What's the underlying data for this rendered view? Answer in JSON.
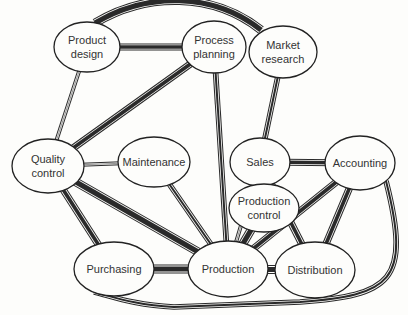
{
  "diagram": {
    "type": "network",
    "nodes": [
      {
        "id": "product_design",
        "lines": [
          "Product",
          "design"
        ],
        "cx": 87,
        "cy": 47,
        "rx": 33,
        "ry": 25
      },
      {
        "id": "process_planning",
        "lines": [
          "Process",
          "planning"
        ],
        "cx": 214,
        "cy": 47,
        "rx": 32,
        "ry": 26
      },
      {
        "id": "market_research",
        "lines": [
          "Market",
          "research"
        ],
        "cx": 283,
        "cy": 52,
        "rx": 34,
        "ry": 26
      },
      {
        "id": "quality_control",
        "lines": [
          "Quality",
          "control"
        ],
        "cx": 48,
        "cy": 166,
        "rx": 36,
        "ry": 27
      },
      {
        "id": "maintenance",
        "lines": [
          "Maintenance"
        ],
        "cx": 154,
        "cy": 162,
        "rx": 36,
        "ry": 25
      },
      {
        "id": "sales",
        "lines": [
          "Sales"
        ],
        "cx": 260,
        "cy": 162,
        "rx": 30,
        "ry": 24
      },
      {
        "id": "accounting",
        "lines": [
          "Accounting"
        ],
        "cx": 360,
        "cy": 163,
        "rx": 35,
        "ry": 27
      },
      {
        "id": "production_control",
        "lines": [
          "Production",
          "control"
        ],
        "cx": 264,
        "cy": 208,
        "rx": 35,
        "ry": 24
      },
      {
        "id": "purchasing",
        "lines": [
          "Purchasing"
        ],
        "cx": 114,
        "cy": 269,
        "rx": 40,
        "ry": 27
      },
      {
        "id": "production",
        "lines": [
          "Production"
        ],
        "cx": 228,
        "cy": 269,
        "rx": 40,
        "ry": 28
      },
      {
        "id": "distribution",
        "lines": [
          "Distribution"
        ],
        "cx": 315,
        "cy": 270,
        "rx": 40,
        "ry": 28
      }
    ],
    "edges": [
      {
        "from": "product_design",
        "to": "market_research",
        "curve": "arc-top",
        "weight": 5
      },
      {
        "from": "product_design",
        "to": "process_planning",
        "weight": 4
      },
      {
        "from": "product_design",
        "to": "quality_control",
        "weight": 2
      },
      {
        "from": "process_planning",
        "to": "quality_control",
        "weight": 4
      },
      {
        "from": "process_planning",
        "to": "production",
        "weight": 3
      },
      {
        "from": "market_research",
        "to": "sales",
        "weight": 3
      },
      {
        "from": "quality_control",
        "to": "maintenance",
        "weight": 2
      },
      {
        "from": "quality_control",
        "to": "purchasing",
        "weight": 4
      },
      {
        "from": "quality_control",
        "to": "production",
        "weight": 5
      },
      {
        "from": "maintenance",
        "to": "production",
        "weight": 3
      },
      {
        "from": "sales",
        "to": "accounting",
        "weight": 4
      },
      {
        "from": "sales",
        "to": "production_control",
        "weight": 2
      },
      {
        "from": "sales",
        "to": "production",
        "weight": 2
      },
      {
        "from": "sales",
        "to": "distribution",
        "weight": 4
      },
      {
        "from": "accounting",
        "to": "production",
        "weight": 4
      },
      {
        "from": "accounting",
        "to": "distribution",
        "weight": 4
      },
      {
        "from": "accounting",
        "to": "purchasing",
        "curve": "loop-bottom",
        "weight": 3
      },
      {
        "from": "production_control",
        "to": "production",
        "weight": 5
      },
      {
        "from": "purchasing",
        "to": "production",
        "weight": 5
      },
      {
        "from": "production",
        "to": "distribution",
        "weight": 5
      }
    ]
  }
}
